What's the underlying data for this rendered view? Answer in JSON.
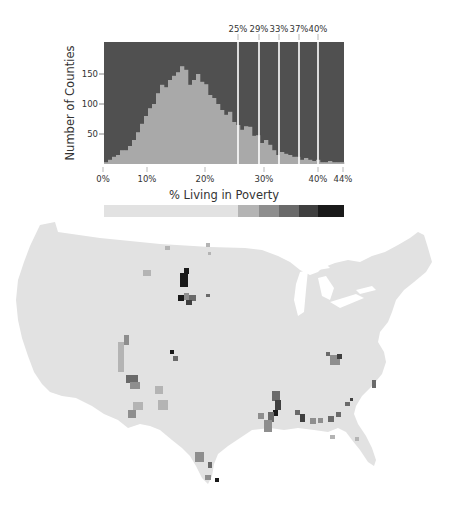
{
  "chart_data": {
    "type": "bar",
    "title": "",
    "xlabel": "% Living in Poverty",
    "ylabel": "Number of Counties",
    "xlim": [
      0,
      44
    ],
    "ylim": [
      0,
      203
    ],
    "grid": false,
    "x_ticks": [
      "0%",
      "10%",
      "20%",
      "30%",
      "40%",
      "44%"
    ],
    "x_tick_values": [
      0,
      10,
      20,
      30,
      40,
      44
    ],
    "y_ticks": [
      "50",
      "100",
      "150"
    ],
    "y_tick_values": [
      50,
      100,
      150
    ],
    "threshold_labels": [
      "25%",
      "29%",
      "33%",
      "37%",
      "40%"
    ],
    "threshold_values": [
      25,
      29,
      33,
      37,
      40
    ],
    "bin_width_pct": 0.733,
    "bins_start": 0,
    "values": [
      3,
      7,
      12,
      15,
      23,
      23,
      30,
      40,
      53,
      67,
      80,
      93,
      100,
      118,
      132,
      128,
      140,
      147,
      153,
      163,
      157,
      132,
      140,
      150,
      137,
      133,
      115,
      110,
      100,
      90,
      82,
      87,
      70,
      65,
      57,
      63,
      62,
      47,
      48,
      35,
      40,
      32,
      23,
      15,
      20,
      17,
      15,
      12,
      12,
      7,
      10,
      7,
      5,
      7,
      3,
      3,
      5,
      3,
      3,
      3
    ],
    "colors": {
      "bar": "#a9a9a9",
      "background": "#505050",
      "threshold_line": "#ffffff"
    },
    "legend_scale": {
      "classes": [
        "<25%",
        "25-29%",
        "29-33%",
        "33-37%",
        "37-40%",
        ">40%"
      ],
      "colors": [
        "#e2e2e2",
        "#b4b4b4",
        "#8e8e8e",
        "#6a6a6a",
        "#3f3f3f",
        "#1a1a1a"
      ]
    }
  },
  "map": {
    "title": "US counties shaded by % living in poverty",
    "base_color": "#e2e2e2"
  }
}
